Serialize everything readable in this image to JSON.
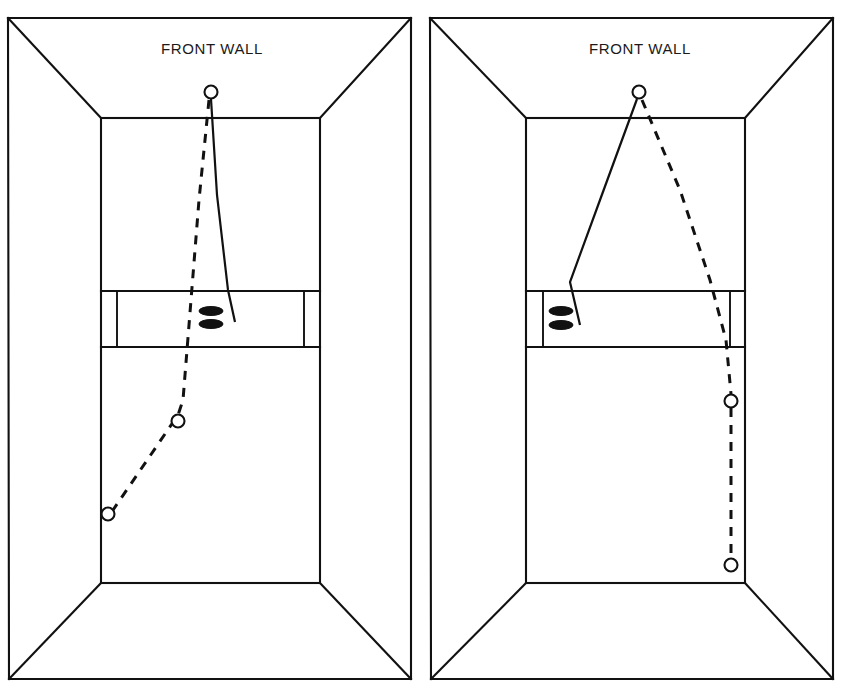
{
  "figure": {
    "panel_count": 2,
    "line_color": "#111111",
    "background_color": "#ffffff",
    "divider_x": 420
  },
  "panels": [
    {
      "id": "panel-left",
      "name": "left-court-diagram",
      "front_wall_label": "FRONT WALL",
      "label_position": {
        "x": 212,
        "y": 50
      },
      "outer_frame": {
        "top_left": {
          "x": 8,
          "y": 18
        },
        "top_right": {
          "x": 411,
          "y": 18
        },
        "bottom_right": {
          "x": 411,
          "y": 679
        },
        "bottom_left": {
          "x": 9,
          "y": 679
        }
      },
      "front_wall_rect": {
        "left": 101,
        "top": 118,
        "right": 320,
        "bottom": 583
      },
      "perspective_edges": [
        {
          "from": {
            "x": 8,
            "y": 18
          },
          "to": {
            "x": 101,
            "y": 118
          }
        },
        {
          "from": {
            "x": 411,
            "y": 18
          },
          "to": {
            "x": 320,
            "y": 118
          }
        },
        {
          "from": {
            "x": 9,
            "y": 679
          },
          "to": {
            "x": 101,
            "y": 583
          }
        },
        {
          "from": {
            "x": 411,
            "y": 679
          },
          "to": {
            "x": 320,
            "y": 583
          }
        }
      ],
      "service_band": {
        "top_y": 291,
        "bottom_y": 347,
        "left_inner_x": 117,
        "right_inner_x": 304
      },
      "solid_trajectory": {
        "label": "incoming-shot",
        "points": [
          {
            "x": 211,
            "y": 99
          },
          {
            "x": 217,
            "y": 195
          },
          {
            "x": 228,
            "y": 290
          },
          {
            "x": 235,
            "y": 322
          }
        ]
      },
      "dashed_trajectory": {
        "label": "rebound-path",
        "points": [
          {
            "x": 209,
            "y": 100
          },
          {
            "x": 199,
            "y": 200
          },
          {
            "x": 191,
            "y": 300
          },
          {
            "x": 183,
            "y": 400
          },
          {
            "x": 178,
            "y": 415
          },
          {
            "x": 113,
            "y": 510
          }
        ]
      },
      "balls": [
        {
          "name": "ball-front-wall",
          "x": 211,
          "y": 92,
          "r": 6.5
        },
        {
          "name": "ball-mid-court",
          "x": 178,
          "y": 421,
          "r": 6.5
        },
        {
          "name": "ball-side-wall",
          "x": 108,
          "y": 514,
          "r": 6.5
        }
      ],
      "shoes": [
        {
          "name": "shoe-left",
          "cx": 211,
          "cy": 311,
          "rx": 12,
          "ry": 4.5
        },
        {
          "name": "shoe-right",
          "cx": 211,
          "cy": 324,
          "rx": 12,
          "ry": 4.5
        }
      ]
    },
    {
      "id": "panel-right",
      "name": "right-court-diagram",
      "front_wall_label": "FRONT WALL",
      "label_position": {
        "x": 640,
        "y": 50
      },
      "outer_frame": {
        "top_left": {
          "x": 430,
          "y": 18
        },
        "top_right": {
          "x": 833,
          "y": 18
        },
        "bottom_right": {
          "x": 833,
          "y": 679
        },
        "bottom_left": {
          "x": 431,
          "y": 679
        }
      },
      "front_wall_rect": {
        "left": 526,
        "top": 118,
        "right": 745,
        "bottom": 583
      },
      "perspective_edges": [
        {
          "from": {
            "x": 430,
            "y": 18
          },
          "to": {
            "x": 526,
            "y": 118
          }
        },
        {
          "from": {
            "x": 833,
            "y": 18
          },
          "to": {
            "x": 745,
            "y": 118
          }
        },
        {
          "from": {
            "x": 431,
            "y": 679
          },
          "to": {
            "x": 526,
            "y": 583
          }
        },
        {
          "from": {
            "x": 833,
            "y": 679
          },
          "to": {
            "x": 745,
            "y": 583
          }
        }
      ],
      "service_band": {
        "top_y": 291,
        "bottom_y": 347,
        "left_inner_x": 543,
        "right_inner_x": 730
      },
      "solid_trajectory": {
        "label": "incoming-shot",
        "points": [
          {
            "x": 637,
            "y": 99
          },
          {
            "x": 600,
            "y": 200
          },
          {
            "x": 570,
            "y": 282
          },
          {
            "x": 580,
            "y": 325
          }
        ]
      },
      "dashed_trajectory": {
        "label": "rebound-path",
        "points": [
          {
            "x": 642,
            "y": 100
          },
          {
            "x": 680,
            "y": 190
          },
          {
            "x": 710,
            "y": 280
          },
          {
            "x": 726,
            "y": 340
          },
          {
            "x": 731,
            "y": 394
          },
          {
            "x": 731,
            "y": 558
          }
        ]
      },
      "balls": [
        {
          "name": "ball-front-wall",
          "x": 639,
          "y": 92,
          "r": 6.5
        },
        {
          "name": "ball-mid-court",
          "x": 731,
          "y": 401,
          "r": 6.5
        },
        {
          "name": "ball-floor",
          "x": 731,
          "y": 565,
          "r": 6.5
        }
      ],
      "shoes": [
        {
          "name": "shoe-left",
          "cx": 561,
          "cy": 311,
          "rx": 12,
          "ry": 4.5
        },
        {
          "name": "shoe-right",
          "cx": 561,
          "cy": 325,
          "rx": 12,
          "ry": 4.5
        }
      ]
    }
  ]
}
